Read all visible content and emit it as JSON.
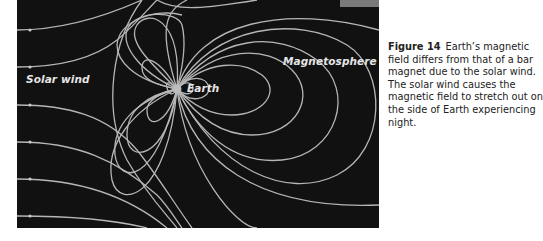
{
  "figure": {
    "labels": {
      "solar_wind": "Solar wind",
      "earth": "Earth",
      "magnetosphere": "Magnetosphere"
    },
    "colors": {
      "background": "#111111",
      "field_lines": "#c8c8c8"
    }
  },
  "caption": {
    "number": "Figure 14",
    "text": "Earth’s magnetic field differs from that of a bar magnet due to the solar wind. The solar wind causes the magnetic field to stretch out on the side of Earth experiencing night."
  }
}
